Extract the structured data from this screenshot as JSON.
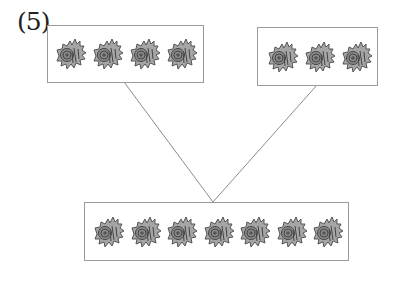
{
  "problem": {
    "label": "(5)",
    "top_left_group": {
      "item": "shell",
      "count": 4
    },
    "top_right_group": {
      "item": "shell",
      "count": 3
    },
    "bottom_group": {
      "item": "shell",
      "count": 7
    },
    "relation": "4 + 3 = 7 (two parts combine into a whole)"
  },
  "colors": {
    "border": "#9a9a9a",
    "line": "#8c8c8c",
    "shell_fill": "#9c9c9c",
    "shell_dark": "#555555"
  }
}
